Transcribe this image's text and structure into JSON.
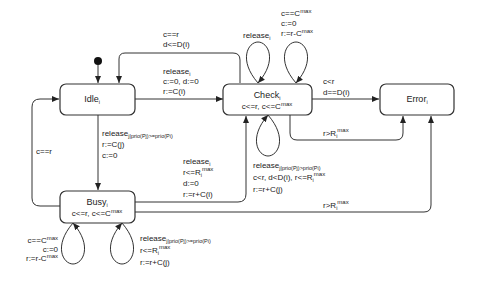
{
  "diagram": {
    "type": "state-machine",
    "states": [
      {
        "id": "idle",
        "name": "Idle",
        "sub": "i",
        "invariant": ""
      },
      {
        "id": "check",
        "name": "Check",
        "sub": "i",
        "invariant_a": "c<=r, c<=C",
        "invariant_sup": "max"
      },
      {
        "id": "error",
        "name": "Error",
        "sub": "i",
        "invariant": ""
      },
      {
        "id": "busy",
        "name": "Busy",
        "sub": "i",
        "invariant_a": "c<=r, c<=C",
        "invariant_sup": "max"
      }
    ],
    "initial_state": "idle",
    "transitions": {
      "check_to_idle": {
        "guard1": "c==r",
        "guard2": "d<=D(i)"
      },
      "idle_to_check": {
        "event": "release",
        "event_sub": "i",
        "assign1": "c:=0, d:=0",
        "assign2": "r:=C(i)"
      },
      "check_self_release": {
        "event": "release",
        "event_sub": "i"
      },
      "check_self_overflow": {
        "guard": "c==C",
        "guard_sup": "max",
        "assign1": "c:=0",
        "assign2": "r:=r-C",
        "assign2_sup": "max"
      },
      "check_to_error_deadline": {
        "guard1": "c<r",
        "guard2": "d==D(i)"
      },
      "check_to_error_response": {
        "guard": "r>R",
        "guard_sub": "i",
        "guard_sup": "max"
      },
      "idle_to_busy": {
        "event": "release",
        "event_sub": "j|prio(Pj)>=prio(Pi)",
        "assign1": "r:=C(j)",
        "assign2": "c:=0"
      },
      "busy_to_idle": {
        "guard": "c==r"
      },
      "busy_to_check": {
        "event": "release",
        "event_sub": "i",
        "guard": "r<=R",
        "guard_sub": "i",
        "guard_sup": "max",
        "assign1": "d:=0",
        "assign2": "r:=r+C(i)"
      },
      "check_self_preempt": {
        "event": "release",
        "event_sub": "j|prio(Pj)>prio(Pi)",
        "guard_a": "c<r, d<D(i), r<=R",
        "guard_sub": "i",
        "guard_sup": "max",
        "assign": "r:=r+C(j)"
      },
      "busy_to_error": {
        "guard": "r>R",
        "guard_sub": "i",
        "guard_sup": "max"
      },
      "busy_self_overflow": {
        "guard": "c==C",
        "guard_sup": "max",
        "assign1": "c:=0",
        "assign2": "r:=r-C",
        "assign2_sup": "max"
      },
      "busy_self_release": {
        "event": "release",
        "event_sub": "j|prio(Pj)>=prio(Pi)",
        "guard": "r<=R",
        "guard_sub": "i",
        "guard_sup": "max",
        "assign": "r:=r+C(j)"
      }
    }
  }
}
